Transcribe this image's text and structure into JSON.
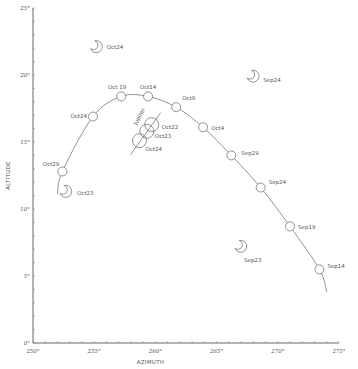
{
  "chart_data": {
    "type": "scatter",
    "title": "",
    "xlabel": "AZIMUTH",
    "ylabel": "ALTITUDE",
    "xlim": [
      250,
      275
    ],
    "ylim": [
      0,
      25
    ],
    "grid": false,
    "x_ticks": [
      "250°",
      "255°",
      "260°",
      "265°",
      "270°",
      "275°"
    ],
    "y_ticks": [
      "0°",
      "5°",
      "10°",
      "15°",
      "20°",
      "25°"
    ],
    "series": [
      {
        "name": "Venus path",
        "style": "line-with-circles",
        "points": [
          {
            "label": "Sep14",
            "x": 273.4,
            "y": 5.5
          },
          {
            "label": "Sep19",
            "x": 271.0,
            "y": 8.7
          },
          {
            "label": "Sep24",
            "x": 268.6,
            "y": 11.6
          },
          {
            "label": "Sep29",
            "x": 266.2,
            "y": 14.0
          },
          {
            "label": "Oct4",
            "x": 263.9,
            "y": 16.1
          },
          {
            "label": "Oct9",
            "x": 261.7,
            "y": 17.6
          },
          {
            "label": "Oct14",
            "x": 259.4,
            "y": 18.4
          },
          {
            "label": "Oct 19",
            "x": 257.2,
            "y": 18.4
          },
          {
            "label": "Oct24",
            "x": 254.9,
            "y": 16.9
          },
          {
            "label": "Oct29",
            "x": 252.4,
            "y": 12.8
          }
        ]
      },
      {
        "name": "Jupiter",
        "style": "large-circles",
        "label": "Jupiter",
        "points": [
          {
            "label": "Oct22",
            "x": 259.7,
            "y": 16.3
          },
          {
            "label": "Oct23",
            "x": 259.3,
            "y": 15.8
          },
          {
            "label": "Oct24",
            "x": 258.7,
            "y": 15.1
          }
        ]
      },
      {
        "name": "Moon",
        "style": "crescent",
        "points": [
          {
            "label": "Oct24",
            "x": 255.2,
            "y": 22.1
          },
          {
            "label": "Oct23",
            "x": 252.7,
            "y": 11.3
          },
          {
            "label": "Sep24",
            "x": 268.0,
            "y": 19.9
          },
          {
            "label": "Sep23",
            "x": 267.0,
            "y": 7.2
          }
        ]
      }
    ]
  }
}
